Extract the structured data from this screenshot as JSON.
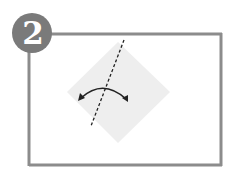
{
  "step": {
    "number": "2",
    "badge_color": "#7a7a7a",
    "number_color": "#ffffff"
  },
  "frame": {
    "border_color": "#8c8c8c"
  },
  "diagram": {
    "paper_shape": "diamond",
    "paper_color": "#eeeeee",
    "fold_line": "dashed",
    "fold_arrow": "curved-double-arrow",
    "line_color": "#222222"
  }
}
